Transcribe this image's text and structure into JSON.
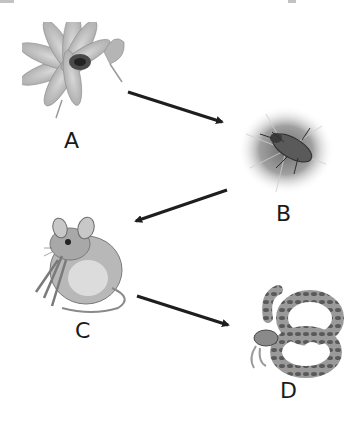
{
  "diagram": {
    "type": "food-chain",
    "nodes": [
      {
        "id": "A",
        "label": "A",
        "depicts": "flower"
      },
      {
        "id": "B",
        "label": "B",
        "depicts": "insect-on-flower"
      },
      {
        "id": "C",
        "label": "C",
        "depicts": "mouse"
      },
      {
        "id": "D",
        "label": "D",
        "depicts": "snake"
      }
    ],
    "edges": [
      {
        "from": "A",
        "to": "B"
      },
      {
        "from": "B",
        "to": "C"
      },
      {
        "from": "C",
        "to": "D"
      }
    ],
    "colors": {
      "arrow": "#1e1e1e",
      "label": "#1a1a1a",
      "illustration": "#8a8a8a"
    }
  }
}
